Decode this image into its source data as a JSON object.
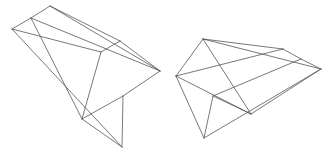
{
  "diagram": {
    "type": "wireframe-polyhedra",
    "stroke_color": "#555555",
    "background": "#ffffff",
    "shapes": [
      {
        "name": "left-polyhedron",
        "vertices": {
          "A": [
            50,
            6
          ],
          "B": [
            31,
            18
          ],
          "C": [
            12,
            29
          ],
          "D": [
            101,
            52
          ],
          "E": [
            120,
            41
          ],
          "F": [
            160,
            71
          ],
          "G": [
            123,
            96
          ],
          "H": [
            82,
            119
          ],
          "I": [
            122,
            147
          ]
        },
        "edges": [
          [
            "A",
            "B"
          ],
          [
            "B",
            "C"
          ],
          [
            "A",
            "E"
          ],
          [
            "A",
            "F"
          ],
          [
            "E",
            "F"
          ],
          [
            "C",
            "D"
          ],
          [
            "D",
            "E"
          ],
          [
            "B",
            "F"
          ],
          [
            "B",
            "H"
          ],
          [
            "D",
            "H"
          ],
          [
            "C",
            "I"
          ],
          [
            "F",
            "G"
          ],
          [
            "G",
            "H"
          ],
          [
            "G",
            "I"
          ],
          [
            "H",
            "I"
          ]
        ]
      },
      {
        "name": "right-polyhedron",
        "vertices": {
          "P": [
            203,
            39
          ],
          "Q": [
            176,
            76
          ],
          "R": [
            283,
            49
          ],
          "S": [
            301,
            59
          ],
          "T": [
            321,
            69
          ],
          "U": [
            251,
            114
          ],
          "V": [
            213,
            96
          ],
          "W": [
            204,
            138
          ]
        },
        "edges": [
          [
            "P",
            "Q"
          ],
          [
            "P",
            "R"
          ],
          [
            "P",
            "T"
          ],
          [
            "R",
            "S"
          ],
          [
            "S",
            "T"
          ],
          [
            "Q",
            "R"
          ],
          [
            "Q",
            "U"
          ],
          [
            "P",
            "U"
          ],
          [
            "T",
            "U"
          ],
          [
            "S",
            "V"
          ],
          [
            "Q",
            "W"
          ],
          [
            "V",
            "W"
          ],
          [
            "V",
            "U"
          ],
          [
            "W",
            "T"
          ]
        ]
      }
    ]
  }
}
